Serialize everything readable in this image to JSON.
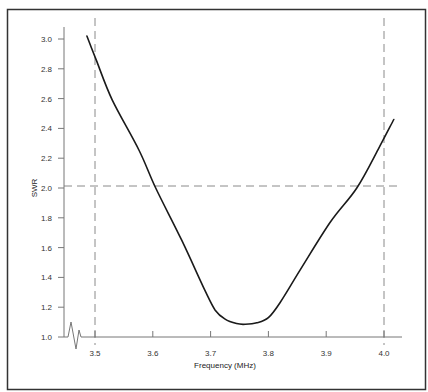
{
  "chart_data": {
    "type": "line",
    "title": "",
    "xlabel": "Frequency (MHz)",
    "ylabel": "SWR",
    "xlim": [
      3.45,
      4.03
    ],
    "ylim": [
      1.0,
      3.0
    ],
    "grid": false,
    "legend": null,
    "x_ticks": [
      "3.5",
      "3.6",
      "3.7",
      "3.8",
      "3.9",
      "4.0"
    ],
    "y_ticks": [
      "1.0",
      "1.2",
      "1.4",
      "1.6",
      "1.8",
      "2.0",
      "2.2",
      "2.4",
      "2.6",
      "2.8",
      "3.0"
    ],
    "series": [
      {
        "name": "SWR",
        "color": "#1a1a1a",
        "x": [
          3.486,
          3.502,
          3.53,
          3.576,
          3.605,
          3.65,
          3.69,
          3.708,
          3.725,
          3.745,
          3.76,
          3.78,
          3.8,
          3.82,
          3.855,
          3.907,
          3.953,
          3.99,
          4.017
        ],
        "y": [
          3.02,
          2.86,
          2.59,
          2.255,
          2.0,
          1.65,
          1.315,
          1.18,
          1.12,
          1.09,
          1.085,
          1.095,
          1.13,
          1.23,
          1.45,
          1.77,
          2.0,
          2.26,
          2.46
        ]
      }
    ],
    "reference_lines": [
      {
        "orientation": "vertical",
        "x": 3.5,
        "style": "dashed",
        "color": "#888888"
      },
      {
        "orientation": "vertical",
        "x": 4.0,
        "style": "dashed",
        "color": "#888888"
      },
      {
        "orientation": "horizontal",
        "y": 2.0,
        "style": "dashed",
        "color": "#888888"
      }
    ],
    "annotations": [
      "axis break symbol near y-axis origin"
    ]
  },
  "labels": {
    "xlabel": "Frequency (MHz)",
    "ylabel": "SWR",
    "x_ticks": [
      "3.5",
      "3.6",
      "3.7",
      "3.8",
      "3.9",
      "4.0"
    ],
    "y_ticks": [
      "1.0",
      "1.2",
      "1.4",
      "1.6",
      "1.8",
      "2.0",
      "2.2",
      "2.4",
      "2.6",
      "2.8",
      "3.0"
    ]
  }
}
